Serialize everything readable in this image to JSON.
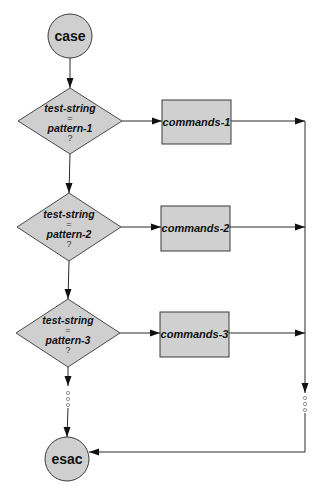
{
  "diagram": {
    "start": {
      "label": "case",
      "cx": 70,
      "cy": 36,
      "r": 22
    },
    "end": {
      "label": "esac",
      "cx": 67,
      "cy": 459,
      "r": 22
    },
    "branches": [
      {
        "test_label": "test-string",
        "operator": "=",
        "pattern_label": "pattern-1",
        "question": "?",
        "command_label": "commands-1",
        "diamond": {
          "cx": 70,
          "cy": 121,
          "hw": 52,
          "hh": 33
        },
        "rect": {
          "x": 162,
          "y": 100,
          "w": 69,
          "h": 44
        }
      },
      {
        "test_label": "test-string",
        "operator": "=",
        "pattern_label": "pattern-2",
        "question": "?",
        "command_label": "commands-2",
        "diamond": {
          "cx": 69,
          "cy": 227,
          "hw": 52,
          "hh": 34
        },
        "rect": {
          "x": 161,
          "y": 206,
          "w": 69,
          "h": 45
        }
      },
      {
        "test_label": "test-string",
        "operator": "=",
        "pattern_label": "pattern-3",
        "question": "?",
        "command_label": "commands-3",
        "diamond": {
          "cx": 68,
          "cy": 333,
          "hw": 52,
          "hh": 34
        },
        "rect": {
          "x": 160,
          "y": 312,
          "w": 69,
          "h": 45
        }
      }
    ],
    "merge_line_x": 305,
    "merge_bottom_y": 452,
    "continuation_marker": "ellipsis-dots",
    "colors": {
      "node_fill": "#cfcfcf",
      "stroke": "#2a2a2a",
      "background": "#ffffff"
    }
  }
}
